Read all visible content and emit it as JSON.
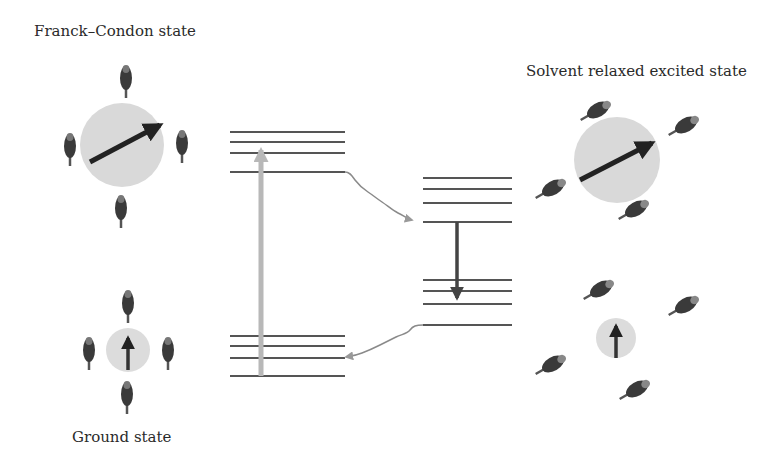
{
  "labels": {
    "franck_condon": "Franck–Condon state",
    "solvent_relaxed": "Solvent relaxed excited state",
    "ground": "Ground state"
  },
  "colors": {
    "level_line": "#555555",
    "absorption_arrow": "#b8b8b8",
    "emission_arrow": "#444444",
    "relaxation_arrow": "#8a8a8a",
    "dipole_circle": "#d9d9d9",
    "dipole_arrow": "#222222",
    "solvent_molecule": "#3a3a3a"
  },
  "energy_levels": {
    "fc_excited": {
      "x1": 230,
      "x2": 345,
      "y": [
        132,
        142,
        153,
        172
      ]
    },
    "fc_ground": {
      "x1": 230,
      "x2": 345,
      "y": [
        336,
        346,
        358,
        376
      ]
    },
    "relaxed_excited": {
      "x1": 423,
      "x2": 512,
      "y": [
        178,
        189,
        203,
        222
      ]
    },
    "relaxed_ground": {
      "x1": 423,
      "x2": 512,
      "y": [
        280,
        291,
        304,
        325
      ]
    }
  },
  "transitions": [
    {
      "name": "absorption",
      "from": "ground state v0",
      "to": "Franck-Condon excited v2"
    },
    {
      "name": "solvent-relaxation-excited",
      "from": "Franck-Condon excited v0",
      "to": "relaxed excited v0"
    },
    {
      "name": "emission",
      "from": "relaxed excited v0",
      "to": "relaxed ground v2"
    },
    {
      "name": "solvent-relaxation-ground",
      "from": "relaxed ground",
      "to": "ground state v2"
    }
  ]
}
